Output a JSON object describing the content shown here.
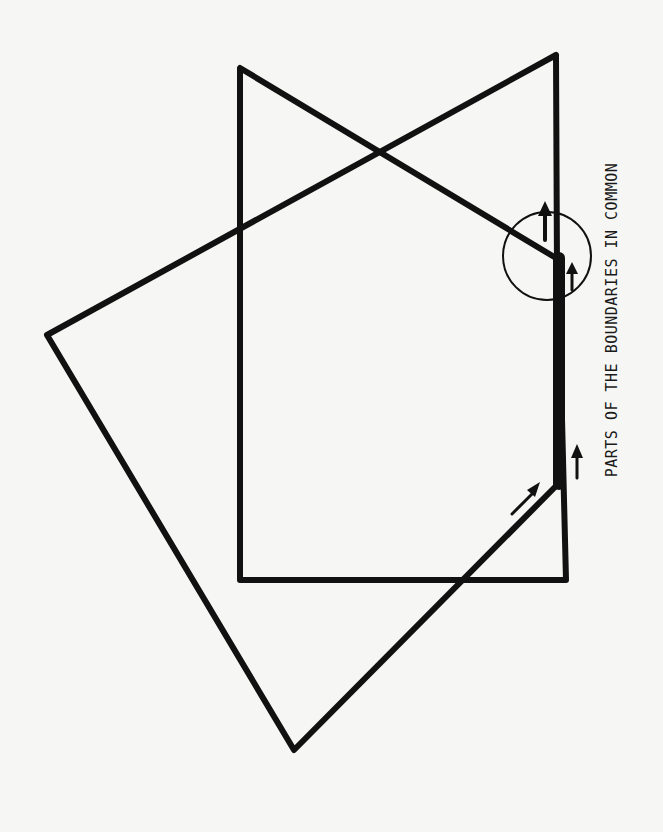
{
  "caption": "PARTS OF THE BOUNDARIES IN COMMON",
  "colors": {
    "ink": "#111111",
    "paper": "#f6f6f4"
  },
  "shapes": {
    "rectangle": {
      "points": "240,68 566,580",
      "desc": "Rectangle with notch"
    },
    "polygon": {
      "desc": "Irregular pentagon overlapping rectangle"
    }
  },
  "annotations": {
    "circle": {
      "cx": 547,
      "cy": 256,
      "r": 44
    },
    "arrows": [
      "arrow-up-top",
      "arrow-up-inner",
      "arrow-up-lower",
      "arrow-diagonal"
    ]
  }
}
